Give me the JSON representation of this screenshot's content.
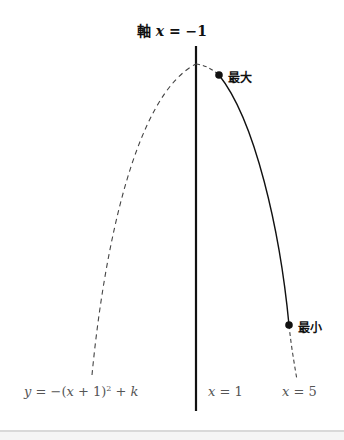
{
  "diagram": {
    "axis_title": {
      "prefix": "軸",
      "var": "x",
      "equals": " = ",
      "value": "−1"
    },
    "points": {
      "max_label": "最大",
      "min_label": "最小"
    },
    "labels": {
      "equation": {
        "y": "y",
        "eq": " = −(",
        "x": "x",
        "plus1": " + 1)",
        "exp": "2",
        "plusk": " + ",
        "k": "k"
      },
      "x1": {
        "var": "x",
        "eq": " = ",
        "val": "1"
      },
      "x5": {
        "var": "x",
        "eq": " = ",
        "val": "5"
      }
    },
    "colors": {
      "ink": "#111111",
      "dashed": "#444444",
      "label_gray": "#555555",
      "footer_line": "#d9d9d9"
    }
  }
}
